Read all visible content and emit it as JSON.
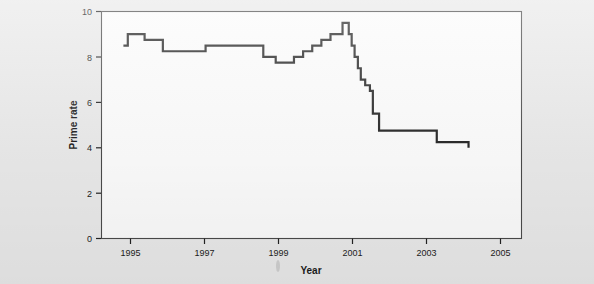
{
  "figure": {
    "background_color": "#e9e9e9",
    "plot_background_color": "#fbfbfb",
    "line_color": "#252525",
    "axis_color": "#4a4a4a"
  },
  "chart_data": {
    "type": "line",
    "title": "",
    "xlabel": "Year",
    "ylabel": "Prime rate",
    "xlim": [
      1994.4,
      2005.9
    ],
    "ylim": [
      0,
      10
    ],
    "xticks": [
      1995,
      1997,
      1999,
      2001,
      2003,
      2005
    ],
    "xtick_labels": [
      "1995",
      "1997",
      "1999",
      "2001",
      "2003",
      "2005"
    ],
    "yticks": [
      0,
      2,
      4,
      6,
      8,
      10
    ],
    "ytick_labels": [
      "0",
      "2",
      "4",
      "6",
      "8",
      "10"
    ],
    "grid": false,
    "legend": null,
    "step_style": "post",
    "x": [
      1995.0,
      1995.12,
      1995.58,
      1996.08,
      1996.5,
      1997.25,
      1998.75,
      1998.83,
      1999.17,
      1999.5,
      1999.67,
      1999.92,
      2000.17,
      2000.42,
      2000.67,
      2001.0,
      2001.08,
      2001.17,
      2001.25,
      2001.33,
      2001.42,
      2001.5,
      2001.62,
      2001.75,
      2001.83,
      2002.0,
      2003.04,
      2003.58,
      2004.45
    ],
    "y": [
      8.5,
      9.0,
      8.75,
      8.25,
      8.25,
      8.5,
      8.5,
      8.0,
      7.75,
      7.75,
      8.0,
      8.25,
      8.5,
      8.75,
      9.0,
      9.5,
      9.5,
      9.0,
      8.5,
      8.0,
      7.5,
      7.0,
      6.75,
      6.5,
      5.5,
      4.75,
      4.75,
      4.25,
      4.0
    ],
    "series": [
      {
        "name": "Prime rate",
        "values": [
          8.5,
          9.0,
          8.75,
          8.25,
          8.25,
          8.5,
          8.5,
          8.0,
          7.75,
          7.75,
          8.0,
          8.25,
          8.5,
          8.75,
          9.0,
          9.5,
          9.5,
          9.0,
          8.5,
          8.0,
          7.5,
          7.0,
          6.75,
          6.5,
          5.5,
          4.75,
          4.75,
          4.25,
          4.0
        ]
      }
    ]
  }
}
